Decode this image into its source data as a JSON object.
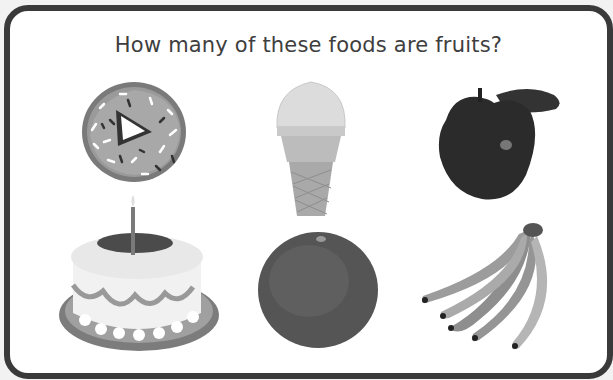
{
  "worksheet": {
    "question": "How many of these foods are fruits?",
    "items": [
      {
        "name": "donut",
        "label": "Donut",
        "is_fruit": false
      },
      {
        "name": "ice-cream-cone",
        "label": "Ice cream cone",
        "is_fruit": false
      },
      {
        "name": "apple",
        "label": "Apple",
        "is_fruit": true
      },
      {
        "name": "birthday-cake",
        "label": "Birthday cake",
        "is_fruit": false
      },
      {
        "name": "orange",
        "label": "Orange",
        "is_fruit": true
      },
      {
        "name": "bananas",
        "label": "Bananas",
        "is_fruit": true
      }
    ]
  },
  "colors": {
    "frame_border": "#3a3a3a",
    "title_text": "#3e3e3e"
  }
}
